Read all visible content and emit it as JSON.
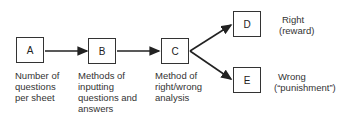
{
  "diagram": {
    "nodes": [
      {
        "id": "A",
        "label": "A",
        "caption": [
          "Number of",
          "questions",
          "per sheet"
        ]
      },
      {
        "id": "B",
        "label": "B",
        "caption": [
          "Methods of",
          "inputting",
          "questions and",
          "answers"
        ]
      },
      {
        "id": "C",
        "label": "C",
        "caption": [
          "Method of",
          "right/wrong",
          "analysis"
        ]
      },
      {
        "id": "D",
        "label": "D",
        "caption": [
          "Right",
          "(reward)"
        ]
      },
      {
        "id": "E",
        "label": "E",
        "caption": [
          "Wrong",
          "(“punishment”)"
        ]
      }
    ],
    "edges": [
      {
        "from": "A",
        "to": "B"
      },
      {
        "from": "B",
        "to": "C"
      },
      {
        "from": "C",
        "to": "D"
      },
      {
        "from": "C",
        "to": "E"
      }
    ]
  }
}
